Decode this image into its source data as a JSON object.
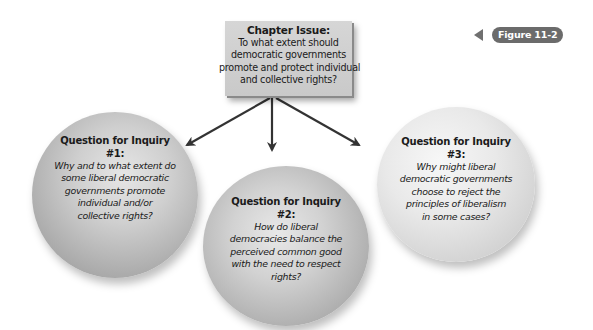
{
  "chapter_issue": {
    "title": "Chapter Issue:",
    "lines": [
      "To what extent should",
      "democratic governments",
      "promote and protect individual",
      "and collective rights?"
    ]
  },
  "figure_label": "Figure 11-2",
  "questions": [
    {
      "title_line1": "Question for Inquiry",
      "title_line2": "#1:",
      "lines": [
        "Why and to what extent do",
        "some liberal democratic",
        "governments promote",
        "individual and/or",
        "collective rights?"
      ]
    },
    {
      "title_line1": "Question for Inquiry",
      "title_line2": "#2:",
      "lines": [
        "How do liberal",
        "democracies balance the",
        "perceived common good",
        "with the need to respect",
        "rights?"
      ]
    },
    {
      "title_line1": "Question for Inquiry",
      "title_line2": "#3:",
      "lines": [
        "Why might liberal",
        "democratic governments",
        "choose to reject the",
        "principles of liberalism",
        "in some cases?"
      ]
    }
  ],
  "colors": {
    "box": "#cccccc",
    "badge": "#6b6b6b",
    "arrow": "#333333"
  }
}
